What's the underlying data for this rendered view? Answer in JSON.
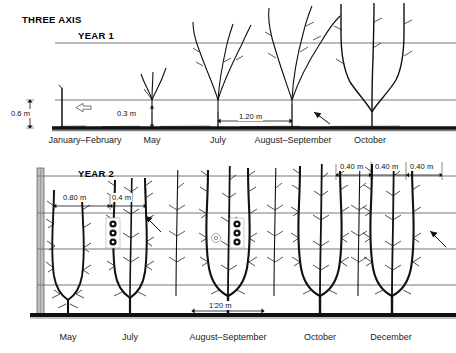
{
  "figure": {
    "title": "THREE AXIS",
    "width": 456,
    "height": 353,
    "background_color": "#ffffff",
    "line_color": "#000000",
    "wire_color": "#6b6b6b",
    "ground_color": "#1a1a1a"
  },
  "year1": {
    "title": "YEAR 1",
    "months": [
      {
        "label": "January–February",
        "x": 85,
        "y": 140
      },
      {
        "label": "May",
        "x": 152,
        "y": 140
      },
      {
        "label": "July",
        "x": 217,
        "y": 140
      },
      {
        "label": "August–September",
        "x": 292,
        "y": 140
      },
      {
        "label": "October",
        "x": 368,
        "y": 140
      }
    ],
    "dimensions": [
      {
        "label": "0.6 m",
        "type": "vertical",
        "x": 42,
        "y": 106
      },
      {
        "label": "0.3 m",
        "type": "vertical",
        "x": 130,
        "y": 112
      },
      {
        "label": "1.20 m",
        "type": "horizontal",
        "x": 230,
        "y": 113
      }
    ],
    "annotations": [
      {
        "name": "bud-arrow",
        "x": 72,
        "y": 104
      },
      {
        "name": "graft-arrow",
        "x": 320,
        "y": 118
      }
    ]
  },
  "year2": {
    "title": "YEAR 2",
    "months": [
      {
        "label": "May",
        "x": 68,
        "y": 338
      },
      {
        "label": "July",
        "x": 130,
        "y": 338
      },
      {
        "label": "August–September",
        "x": 228,
        "y": 338
      },
      {
        "label": "October",
        "x": 320,
        "y": 338
      },
      {
        "label": "December",
        "x": 390,
        "y": 338
      }
    ],
    "dimensions": [
      {
        "label": "0.80 m",
        "type": "horizontal",
        "x": 70,
        "y": 197
      },
      {
        "label": "0.4 m",
        "type": "horizontal",
        "x": 118,
        "y": 197
      },
      {
        "label": "0.40 m",
        "type": "horizontal",
        "x": 352,
        "y": 166
      },
      {
        "label": "0.40 m",
        "type": "horizontal",
        "x": 389,
        "y": 166
      },
      {
        "label": "0.40 m",
        "type": "horizontal",
        "x": 424,
        "y": 166
      },
      {
        "label": "1'20 m",
        "type": "horizontal",
        "x": 225,
        "y": 305
      }
    ],
    "annotations": [
      {
        "name": "tie-clip-left",
        "x": 113,
        "y": 232
      },
      {
        "name": "tie-clip-right",
        "x": 237,
        "y": 232
      },
      {
        "name": "pruning-arrow-left",
        "x": 148,
        "y": 222
      },
      {
        "name": "pruning-arrow-right",
        "x": 432,
        "y": 237
      },
      {
        "name": "pruning-circle",
        "x": 216,
        "y": 238
      }
    ]
  }
}
